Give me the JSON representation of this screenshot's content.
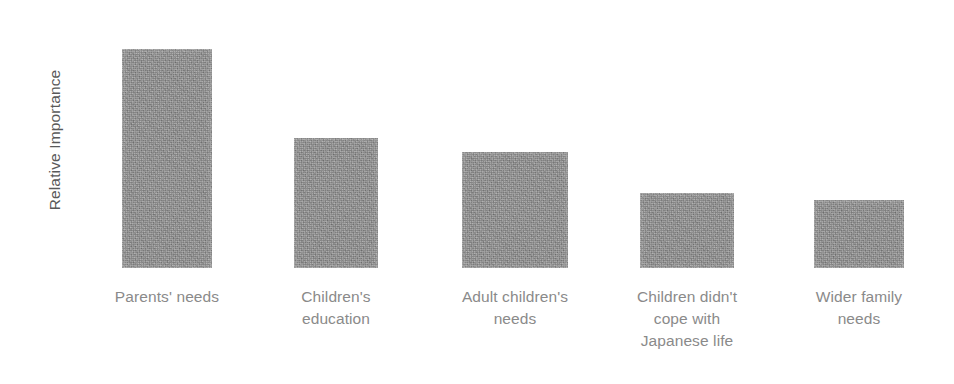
{
  "chart_data": {
    "type": "bar",
    "title": "",
    "subtitle": "",
    "xlabel": "",
    "ylabel": "Relative Importance",
    "categories": [
      "Parents' needs",
      "Children's\neducation",
      "Adult children's\nneeds",
      "Children didn't\ncope with\nJapanese life",
      "Wider family\nneeds"
    ],
    "categories_plain": [
      "Parents' needs",
      "Children's education",
      "Adult children's needs",
      "Children didn't cope with Japanese life",
      "Wider family needs"
    ],
    "values": [
      100,
      59,
      53,
      34,
      31
    ],
    "ylim": [
      0,
      110
    ],
    "grid": false,
    "legend": false,
    "legend_position": "none",
    "axis_ticks_visible": false,
    "bar_color": "#8d8d8d",
    "label_color": "#8a8a8a",
    "axis_title_color": "#595959",
    "background_color": "#ffffff",
    "geometry": {
      "baseline_y": 268,
      "bars": [
        {
          "x": 122,
          "width": 90,
          "top": 49,
          "height": 219
        },
        {
          "x": 294,
          "width": 84,
          "top": 138,
          "height": 130
        },
        {
          "x": 462,
          "width": 106,
          "top": 152,
          "height": 116
        },
        {
          "x": 640,
          "width": 94,
          "top": 193,
          "height": 75
        },
        {
          "x": 814,
          "width": 90,
          "top": 200,
          "height": 68
        }
      ],
      "label_boxes": [
        {
          "x": 87,
          "width": 160
        },
        {
          "x": 270,
          "width": 132
        },
        {
          "x": 432,
          "width": 166
        },
        {
          "x": 602,
          "width": 170
        },
        {
          "x": 779,
          "width": 160
        }
      ]
    }
  }
}
